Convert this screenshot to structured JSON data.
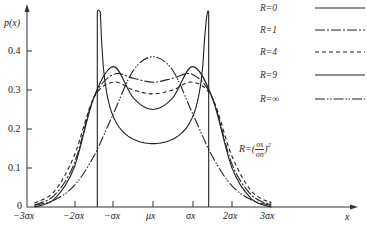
{
  "chart_data": {
    "type": "line",
    "title": "",
    "xlabel": "x",
    "ylabel": "p(x)",
    "ylim": [
      0,
      0.48
    ],
    "xlim": [
      -3,
      3
    ],
    "x_tick_labels": [
      "−3σx",
      "−2σx",
      "−σx",
      "μx",
      "σx",
      "2σx",
      "3σx"
    ],
    "x_tick_values": [
      -3,
      -2,
      -1,
      0,
      1,
      2,
      3
    ],
    "y_tick_labels": [
      "0",
      "0.1",
      "0.2",
      "0.3",
      "0.4"
    ],
    "y_tick_values": [
      0,
      0.1,
      0.2,
      0.3,
      0.4
    ],
    "grid": false,
    "legend_position": "top-right",
    "annotation": "R=(σs/σn)²",
    "x": [
      -3.0,
      -2.5,
      -2.0,
      -1.5,
      -1.0,
      -0.5,
      0.0,
      0.5,
      1.0,
      1.5,
      2.0,
      2.5,
      3.0
    ],
    "series": [
      {
        "name": "R=0",
        "style": "solid",
        "note": "arcsine density bounded at ±1.41σx, spikes at edges",
        "values": [
          0,
          0,
          0,
          0.46,
          0.26,
          0.24,
          0.23,
          0.24,
          0.26,
          0.46,
          0,
          0,
          0
        ]
      },
      {
        "name": "R=1",
        "style": "dash-dot",
        "values": [
          0.005,
          0.03,
          0.11,
          0.28,
          0.34,
          0.33,
          0.32,
          0.33,
          0.34,
          0.28,
          0.11,
          0.03,
          0.005
        ]
      },
      {
        "name": "R=4",
        "style": "dashed",
        "values": [
          0.01,
          0.04,
          0.13,
          0.28,
          0.32,
          0.3,
          0.29,
          0.3,
          0.32,
          0.28,
          0.13,
          0.04,
          0.01
        ]
      },
      {
        "name": "R=9",
        "style": "solid",
        "values": [
          0.0,
          0.02,
          0.1,
          0.28,
          0.36,
          0.28,
          0.25,
          0.28,
          0.36,
          0.28,
          0.1,
          0.02,
          0.0
        ]
      },
      {
        "name": "R=∞",
        "style": "dash-dot-dot",
        "values": [
          0.004,
          0.018,
          0.054,
          0.13,
          0.24,
          0.35,
          0.385,
          0.35,
          0.24,
          0.13,
          0.054,
          0.018,
          0.004
        ]
      }
    ]
  },
  "axes": {
    "y_label": "p(x)",
    "x_label": "x",
    "origin_label": "0"
  },
  "legend": [
    {
      "label": "R=0"
    },
    {
      "label": "R=1"
    },
    {
      "label": "R=4"
    },
    {
      "label": "R=9"
    },
    {
      "label": "R=∞"
    }
  ],
  "annotation": {
    "prefix": "R=",
    "num": "σs",
    "den": "σn",
    "exp": "2"
  }
}
